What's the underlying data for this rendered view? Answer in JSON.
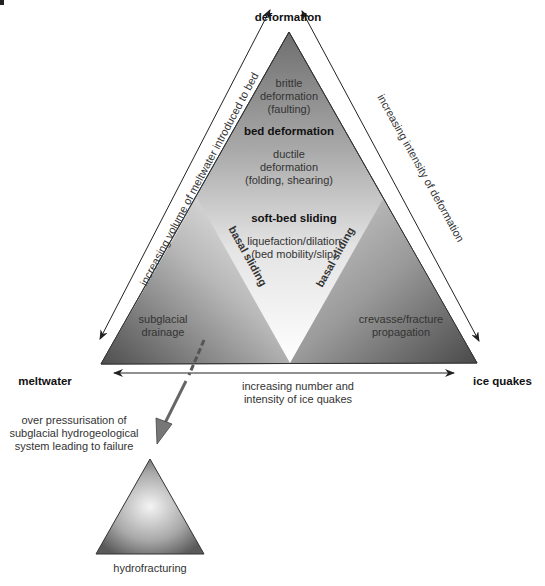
{
  "figure": {
    "corner_fragment": "",
    "vertices": {
      "top": "deformation",
      "left": "meltwater",
      "right": "ice quakes"
    },
    "zones": {
      "brittle": [
        "brittle",
        "deformation",
        "(faulting)"
      ],
      "bed_deformation": "bed deformation",
      "ductile": [
        "ductile",
        "deformation",
        "(folding, shearing)"
      ],
      "soft_bed_sliding": "soft-bed sliding",
      "liquefaction": [
        "liquefaction/dilation",
        "(bed mobility/slip)"
      ],
      "basal_sliding_left": "basal sliding",
      "basal_sliding_right": "basal sliding",
      "subglacial_drainage": [
        "subglacial",
        "drainage"
      ],
      "crevasse": [
        "crevasse/fracture",
        "propagation"
      ]
    },
    "axes": {
      "left": "increasing volume of meltwater introduced to bed",
      "right": "increasing intensity of deformation",
      "bottom": [
        "increasing number and",
        "intensity of ice quakes"
      ]
    },
    "failure": {
      "caption": [
        "over pressurisation of",
        "subglacial hydrogeological",
        "system leading to failure"
      ],
      "result": "hydrofracturing"
    },
    "colors": {
      "dark_gray": "#5a5a5a",
      "mid_gray": "#9a9a9a",
      "light_gray": "#e8e8e8",
      "line": "#333333"
    }
  }
}
